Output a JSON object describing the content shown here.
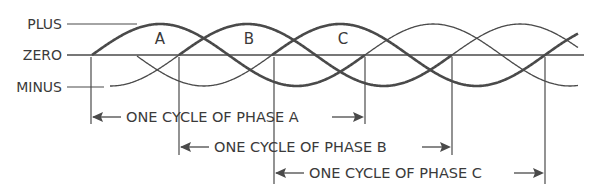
{
  "axis_labels": {
    "plus": "PLUS",
    "zero": "ZERO",
    "minus": "MINUS"
  },
  "phase_labels": {
    "a": "A",
    "b": "B",
    "c": "C"
  },
  "cycle_labels": {
    "a": "ONE CYCLE OF PHASE A",
    "b": "ONE CYCLE OF PHASE B",
    "c": "ONE CYCLE OF PHASE C"
  },
  "geometry": {
    "zero_y": 55,
    "amplitude": 31,
    "period": 273,
    "phase_a_start": 92,
    "phase_b_start": 179,
    "phase_c_start": 272
  },
  "colors": {
    "line": "#4a4a4a",
    "text": "#3a3a3a",
    "background": "#ffffff"
  }
}
